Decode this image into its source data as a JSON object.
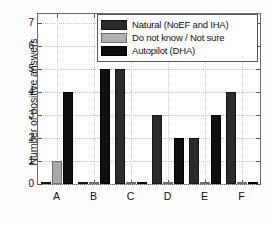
{
  "chart_data": {
    "type": "bar",
    "title": "",
    "xlabel": "",
    "ylabel": "Number of positive answers",
    "categories": [
      "A",
      "B",
      "C",
      "D",
      "E",
      "F"
    ],
    "ylim": [
      0,
      7.4
    ],
    "yticks": [
      0,
      1,
      2,
      3,
      4,
      5,
      6,
      7
    ],
    "ytick_labels": [
      "0",
      "1",
      "2",
      "3",
      "4",
      "5",
      "6",
      "7"
    ],
    "grid": true,
    "legend_position": "top-right",
    "series": [
      {
        "name": "Natural (NoEF and IHA)",
        "color": "#2b2b2b",
        "values": [
          0,
          0,
          5,
          3,
          2,
          4
        ]
      },
      {
        "name": "Do not know / Not sure",
        "color": "#a8a8a8",
        "values": [
          1,
          0,
          0,
          0,
          0,
          0
        ]
      },
      {
        "name": "Autopilot (DHA)",
        "color": "#101010",
        "values": [
          4,
          5,
          0,
          2,
          3,
          0
        ]
      }
    ]
  }
}
